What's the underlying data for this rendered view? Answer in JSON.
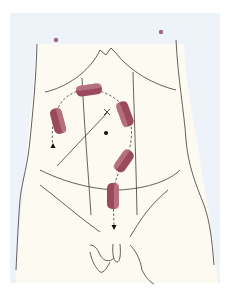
{
  "figure": {
    "type": "anatomical-diagram",
    "colors": {
      "page_background": "#ffffff",
      "panel_background": "#eef3fa",
      "body_fill": "#fdfaf2",
      "outline": "#3a3a3a",
      "port": "#8c3a4e",
      "nipple": "#9a6a86"
    },
    "ports": [
      {
        "id": "port-upper-center",
        "x": 88,
        "y": 90,
        "angle": -8
      },
      {
        "id": "port-left",
        "x": 57,
        "y": 121,
        "angle": 75
      },
      {
        "id": "port-right",
        "x": 125,
        "y": 113,
        "angle": -70
      },
      {
        "id": "port-lower-right",
        "x": 125,
        "y": 160,
        "angle": -55
      },
      {
        "id": "port-lower-center",
        "x": 113,
        "y": 195,
        "angle": 90
      }
    ],
    "markers": {
      "x_mark": {
        "x": 107,
        "y": 112
      },
      "center_dot": {
        "x": 106,
        "y": 133
      },
      "arrow_left": {
        "x": 53,
        "y": 147
      },
      "arrow_bottom": {
        "x": 114,
        "y": 227
      }
    }
  }
}
